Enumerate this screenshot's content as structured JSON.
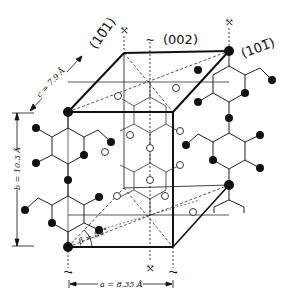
{
  "diagram": {
    "planes": [
      {
        "label": "(10̅1)",
        "display": "(101)",
        "note": "bar over first 1"
      },
      {
        "label": "(002)"
      },
      {
        "label": "(101̅)",
        "display": "(101)",
        "note": "bar over last 1"
      }
    ],
    "dimensions": {
      "a": "a = 8.35 Å",
      "b": "b = 10.3 Å",
      "c": "c = 7.9 Å",
      "beta": "β = 84°"
    },
    "legend": {
      "filled_atom": "#111111",
      "open_atom": "#ffffff",
      "line_color": "#222222",
      "background": "#ffffff"
    }
  },
  "labels": {
    "plane_left": "(10̅1)",
    "plane_top": "(002)",
    "plane_right": "(101̅)",
    "dim_c": "c = 7.9 Å",
    "dim_b": "b = 10.3 Å",
    "dim_a": "a = 8.35 Å",
    "angle_beta": "β = 84°",
    "screw_axis_symbol": "≀"
  }
}
